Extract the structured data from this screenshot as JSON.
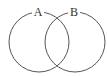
{
  "diagram": {
    "type": "venn",
    "sets": [
      {
        "label": "A",
        "cx": 39,
        "cy": 42,
        "r": 30
      },
      {
        "label": "B",
        "cx": 75,
        "cy": 42,
        "r": 30
      }
    ],
    "stroke_color": "#555555",
    "background": "#ffffff"
  }
}
